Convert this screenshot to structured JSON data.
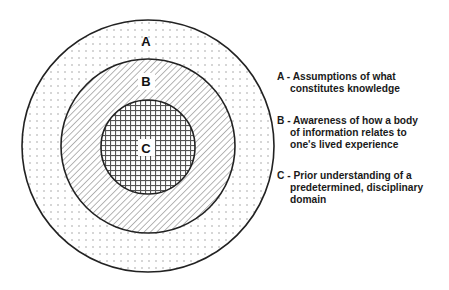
{
  "diagram": {
    "type": "concentric-circles",
    "center": {
      "x": 148,
      "y": 146
    },
    "rings": [
      {
        "id": "A",
        "label": "A",
        "radius": 126,
        "pattern": "dots",
        "label_pos": {
          "x": 146,
          "y": 46
        }
      },
      {
        "id": "B",
        "label": "B",
        "radius": 87,
        "pattern": "diagonal-hatch",
        "label_pos": {
          "x": 146,
          "y": 86
        }
      },
      {
        "id": "C",
        "label": "C",
        "radius": 47,
        "pattern": "crosshatch-grid",
        "label_pos": {
          "x": 146,
          "y": 153
        }
      }
    ],
    "stroke_color": "#222222",
    "pattern_color": "#888888"
  },
  "legend": {
    "items": [
      {
        "key": "A - ",
        "line1": "Assumptions of what",
        "rest": "constitutes knowledge"
      },
      {
        "key": "B - ",
        "line1": "Awareness of how a body",
        "rest": "of information relates to\none's lived experience"
      },
      {
        "key": "C - ",
        "line1": "Prior understanding of a",
        "rest": "predetermined, disciplinary\ndomain"
      }
    ]
  }
}
